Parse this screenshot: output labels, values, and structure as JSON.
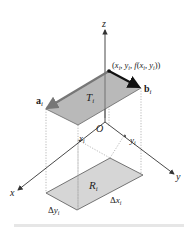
{
  "diagram": {
    "axes": {
      "z_label": "z",
      "x_label": "x",
      "y_label": "y",
      "origin_label": "O"
    },
    "point_label": "(x_i, y_i, f(x_i, y_i))",
    "point_parts": {
      "open": "(",
      "x": "x",
      "xi_sub": "i",
      "comma1": ", ",
      "y": "y",
      "yi_sub": "i",
      "comma2": ", ",
      "f": "f",
      "paren_open": "(",
      "x2": "x",
      "x2_sub": "i",
      "comma3": ", ",
      "y2": "y",
      "y2_sub": "i",
      "close": "))"
    },
    "vector_a": {
      "main": "a",
      "sub": "i"
    },
    "vector_b": {
      "main": "b",
      "sub": "i"
    },
    "tangent_patch": {
      "main": "T",
      "sub": "i"
    },
    "region": {
      "main": "R",
      "sub": "i"
    },
    "tick_x": {
      "main": "x",
      "sub": "i"
    },
    "tick_y": {
      "main": "y",
      "sub": "i"
    },
    "delta_x": {
      "delta": "Δ",
      "main": "x",
      "sub": "i"
    },
    "delta_y": {
      "delta": "Δ",
      "main": "y",
      "sub": "i"
    },
    "colors": {
      "patch_fill": "#b9b9b9",
      "region_fill": "#d6d6d6",
      "axis": "#333333",
      "vector_a": "#7a7a7a",
      "vector_b": "#111111",
      "dotted": "#999999"
    }
  }
}
